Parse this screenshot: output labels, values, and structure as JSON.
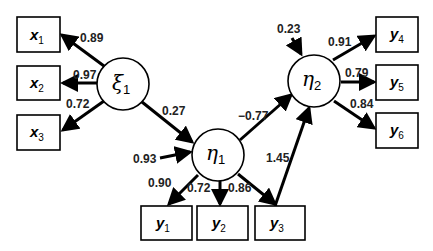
{
  "diagram": {
    "type": "structural-equation-model",
    "latent": [
      {
        "id": "xi1",
        "symbol": "ξ",
        "sub": "1"
      },
      {
        "id": "eta1",
        "symbol": "η",
        "sub": "1"
      },
      {
        "id": "eta2",
        "symbol": "η",
        "sub": "2"
      }
    ],
    "observed": [
      {
        "id": "x1",
        "name": "x",
        "sub": "1"
      },
      {
        "id": "x2",
        "name": "x",
        "sub": "2"
      },
      {
        "id": "x3",
        "name": "x",
        "sub": "3"
      },
      {
        "id": "y1",
        "name": "y",
        "sub": "1"
      },
      {
        "id": "y2",
        "name": "y",
        "sub": "2"
      },
      {
        "id": "y3",
        "name": "y",
        "sub": "3"
      },
      {
        "id": "y4",
        "name": "y",
        "sub": "4"
      },
      {
        "id": "y5",
        "name": "y",
        "sub": "5"
      },
      {
        "id": "y6",
        "name": "y",
        "sub": "6"
      }
    ],
    "paths": [
      {
        "from": "xi1",
        "to": "x1",
        "label": "0.89"
      },
      {
        "from": "xi1",
        "to": "x2",
        "label": "0.97"
      },
      {
        "from": "xi1",
        "to": "x3",
        "label": "0.72"
      },
      {
        "from": "xi1",
        "to": "eta1",
        "label": "0.27"
      },
      {
        "from": "error",
        "to": "eta1",
        "label": "0.93"
      },
      {
        "from": "eta1",
        "to": "eta2",
        "label": "−0.77"
      },
      {
        "from": "eta1",
        "to": "y1",
        "label": "0.90"
      },
      {
        "from": "eta1",
        "to": "y2",
        "label": "0.72"
      },
      {
        "from": "eta1",
        "to": "y3",
        "label": "0.86"
      },
      {
        "from": "y3",
        "to": "eta2",
        "label": "1.45"
      },
      {
        "from": "error",
        "to": "eta2",
        "label": "0.23"
      },
      {
        "from": "eta2",
        "to": "y4",
        "label": "0.91"
      },
      {
        "from": "eta2",
        "to": "y5",
        "label": "0.79"
      },
      {
        "from": "eta2",
        "to": "y6",
        "label": "0.84"
      }
    ]
  }
}
